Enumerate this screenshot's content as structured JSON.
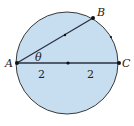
{
  "diagram": {
    "type": "circle-geometry",
    "fill_color": "#c6def0",
    "stroke_color": "#3a3a3a",
    "circle": {
      "cx": 67,
      "cy": 63,
      "r": 51
    },
    "points": [
      {
        "name": "A",
        "label": "A",
        "x": 17,
        "y": 63
      },
      {
        "name": "B",
        "label": "B",
        "x": 93,
        "y": 18
      },
      {
        "name": "C",
        "label": "C",
        "x": 119,
        "y": 63
      },
      {
        "name": "center",
        "label": "",
        "x": 68,
        "y": 63
      }
    ],
    "angle_label": "θ",
    "segment_labels": [
      "2",
      "2"
    ]
  }
}
